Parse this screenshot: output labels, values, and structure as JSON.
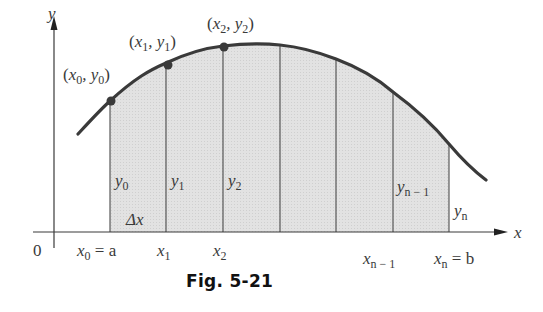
{
  "figure": {
    "caption": "Fig. 5-21",
    "axes": {
      "x_label": "x",
      "y_label": "y",
      "origin_label": "0"
    },
    "points": [
      {
        "label": "(x0, y0)",
        "x_sub": "0",
        "y_sub": "0"
      },
      {
        "label": "(x1, y1)",
        "x_sub": "1",
        "y_sub": "1"
      },
      {
        "label": "(x2, y2)",
        "x_sub": "2",
        "y_sub": "2"
      }
    ],
    "ordinates": [
      {
        "var": "y",
        "sub": "0"
      },
      {
        "var": "y",
        "sub": "1"
      },
      {
        "var": "y",
        "sub": "2"
      },
      {
        "var": "y",
        "sub": "n − 1"
      },
      {
        "var": "y",
        "sub": "n"
      }
    ],
    "abscissas": [
      {
        "var": "x",
        "sub": "0",
        "suffix": " = a"
      },
      {
        "var": "x",
        "sub": "1",
        "suffix": ""
      },
      {
        "var": "x",
        "sub": "2",
        "suffix": ""
      },
      {
        "var": "x",
        "sub": "n − 1",
        "suffix": ""
      },
      {
        "var": "x",
        "sub": "n",
        "suffix": " = b"
      }
    ],
    "delta_label": "Δx",
    "colors": {
      "curve": "#3a3a3a",
      "fill": "#dcdcdc",
      "lines": "#4a4a4a",
      "text": "#3a3a3a"
    },
    "strip_count": 6
  }
}
